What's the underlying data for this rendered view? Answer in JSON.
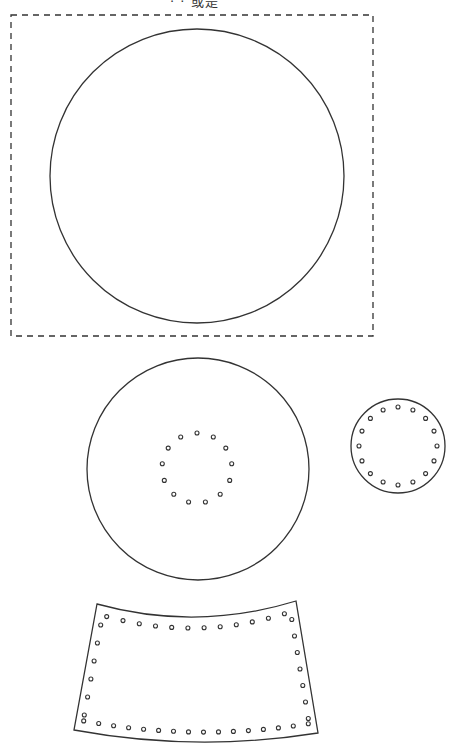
{
  "page": {
    "title_fragment": "· · 或是",
    "background": "#ffffff",
    "stroke_color": "#333333"
  },
  "pattern": {
    "description": "Sewing/craft pattern pieces with stitch holes",
    "pieces": [
      {
        "id": "large-circle",
        "shape": "circle",
        "cx": 197,
        "cy": 176,
        "r": 147,
        "enclosed_by_dashed_rect": {
          "x": 11,
          "y": 15,
          "width": 362,
          "height": 321
        },
        "holes": 0
      },
      {
        "id": "medium-circle",
        "shape": "circle",
        "cx": 198,
        "cy": 469,
        "r": 111,
        "hole_ring": {
          "cx": 197,
          "cy": 468,
          "r": 35,
          "count": 13,
          "hole_r": 2
        }
      },
      {
        "id": "small-circle",
        "shape": "circle",
        "cx": 398,
        "cy": 446,
        "r": 47,
        "hole_ring": {
          "cx": 398,
          "cy": 446,
          "r": 39,
          "count": 16,
          "hole_r": 2
        }
      },
      {
        "id": "curved-band",
        "shape": "curved-trapezoid",
        "corners": {
          "top_left": [
            97,
            604
          ],
          "top_right": [
            296,
            601
          ],
          "bottom_right": [
            318,
            733
          ],
          "bottom_left": [
            74,
            730
          ]
        },
        "top_sag_y": 617,
        "bottom_sag_y": 742,
        "holes": {
          "top_row": 12,
          "left_column": 6,
          "right_column": 7,
          "bottom_row": 16,
          "hole_r": 2
        }
      }
    ]
  }
}
